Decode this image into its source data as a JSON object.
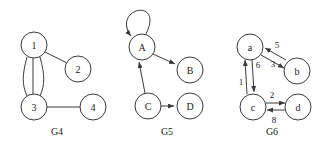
{
  "figure": {
    "background_color": "#ffffff",
    "stroke_color": "#3a3a3a",
    "text_color": "#1a1a1a",
    "width": 329,
    "height": 148
  },
  "graphs": [
    {
      "caption": "G4",
      "caption_x": 57,
      "caption_y": 131,
      "type": "undirected-multigraph",
      "directed": false,
      "weighted": false,
      "nodes": [
        {
          "id": "1",
          "label": "1",
          "cx": 34,
          "cy": 45,
          "r": 13
        },
        {
          "id": "2",
          "label": "2",
          "cx": 78,
          "cy": 69,
          "r": 13
        },
        {
          "id": "3",
          "label": "3",
          "cx": 34,
          "cy": 107,
          "r": 13
        },
        {
          "id": "4",
          "label": "4",
          "cx": 93,
          "cy": 107,
          "r": 13
        }
      ],
      "edges": [
        {
          "from": "1",
          "to": "3",
          "parallel_index": 0
        },
        {
          "from": "1",
          "to": "3",
          "parallel_index": 1
        },
        {
          "from": "1",
          "to": "3",
          "parallel_index": 2
        },
        {
          "from": "1",
          "to": "2"
        },
        {
          "from": "3",
          "to": "4"
        }
      ]
    },
    {
      "caption": "G5",
      "caption_x": 167,
      "caption_y": 131,
      "type": "directed-graph",
      "directed": true,
      "weighted": false,
      "nodes": [
        {
          "id": "A",
          "label": "A",
          "cx": 142,
          "cy": 47,
          "r": 13
        },
        {
          "id": "B",
          "label": "B",
          "cx": 190,
          "cy": 70,
          "r": 13
        },
        {
          "id": "C",
          "label": "C",
          "cx": 148,
          "cy": 106,
          "r": 13
        },
        {
          "id": "D",
          "label": "D",
          "cx": 190,
          "cy": 106,
          "r": 13
        }
      ],
      "edges": [
        {
          "from": "A",
          "to": "A",
          "self_loop": true
        },
        {
          "from": "A",
          "to": "B"
        },
        {
          "from": "C",
          "to": "A"
        },
        {
          "from": "C",
          "to": "D"
        }
      ]
    },
    {
      "caption": "G6",
      "caption_x": 272,
      "caption_y": 131,
      "type": "weighted-directed-graph",
      "directed": true,
      "weighted": true,
      "nodes": [
        {
          "id": "a",
          "label": "a",
          "cx": 250,
          "cy": 47,
          "r": 13
        },
        {
          "id": "b",
          "label": "b",
          "cx": 297,
          "cy": 71,
          "r": 13
        },
        {
          "id": "c",
          "label": "c",
          "cx": 253,
          "cy": 107,
          "r": 13
        },
        {
          "id": "d",
          "label": "d",
          "cx": 298,
          "cy": 107,
          "r": 13
        }
      ],
      "edges": [
        {
          "from": "b",
          "to": "a",
          "weight": "5",
          "wx": 277,
          "wy": 45
        },
        {
          "from": "a",
          "to": "b",
          "weight": "3",
          "wx": 273,
          "wy": 64
        },
        {
          "from": "a",
          "to": "c",
          "weight": "6",
          "wx": 257,
          "wy": 65
        },
        {
          "from": "c",
          "to": "a",
          "weight": "1",
          "wx": 242,
          "wy": 82
        },
        {
          "from": "c",
          "to": "d",
          "weight": "2",
          "wx": 272,
          "wy": 95
        },
        {
          "from": "d",
          "to": "c",
          "weight": "8",
          "wx": 274,
          "wy": 120
        }
      ]
    }
  ]
}
